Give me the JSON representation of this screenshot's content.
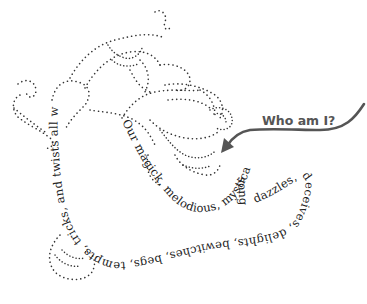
{
  "illustration": {
    "callout": {
      "label": "Who am I?",
      "color": "#555555"
    },
    "poem": {
      "segment_1": "Our magick, melodious, mystical, mythical, musical",
      "segment_2": "song",
      "segment_3": "dazzles, deceives, delights, bewitches, begs, tempts, tricks, and twists all who hear its tune"
    },
    "figure": {
      "style": "dotted-outline",
      "color": "#333333"
    }
  }
}
